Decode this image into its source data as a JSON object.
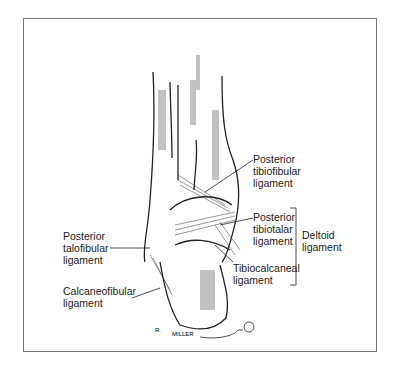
{
  "figure": {
    "labels": {
      "posterior_tibiofibular": [
        "Posterior",
        "tibiofibular",
        "ligament"
      ],
      "posterior_tibiotalar": [
        "Posterior",
        "tibiotalar",
        "ligament"
      ],
      "deltoid": [
        "Deltoid",
        "ligament"
      ],
      "tibiocalcaneal": [
        "Tibiocalcaneal",
        "ligament"
      ],
      "posterior_talofibular": [
        "Posterior",
        "talofibular",
        "ligament"
      ],
      "calcaneofibular": [
        "Calcaneofibular",
        "ligament"
      ]
    },
    "signature": "R. MILLER"
  }
}
